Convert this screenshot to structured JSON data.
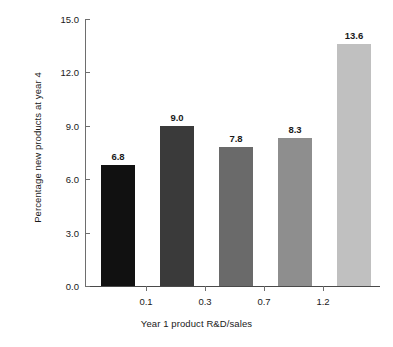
{
  "chart_data": {
    "type": "bar",
    "title": "",
    "xlabel": "Year 1 product R&D/sales",
    "ylabel": "Percentage new products at year 4",
    "categories": [
      "",
      "0.1",
      "0.3",
      "0.7",
      "1.2"
    ],
    "values": [
      6.8,
      9.0,
      7.8,
      8.3,
      13.6
    ],
    "value_labels": [
      "6.8",
      "9.0",
      "7.8",
      "8.3",
      "13.6"
    ],
    "bar_colors": [
      "#111111",
      "#3a3a3a",
      "#6a6a6a",
      "#8e8e8e",
      "#c0c0c0"
    ],
    "ylim": [
      0.0,
      15.0
    ],
    "yticks": [
      0.0,
      3.0,
      6.0,
      9.0,
      12.0,
      15.0
    ],
    "ytick_labels": [
      "0.0",
      "3.0",
      "6.0",
      "9.0",
      "12.0",
      "15.0"
    ],
    "xtick_labels": [
      "0.1",
      "0.3",
      "0.7",
      "1.2"
    ],
    "xtick_note": "x tick labels are placed in the gaps between adjacent bars",
    "grid": false,
    "legend": false,
    "background": "#ffffff",
    "axis_color": "#4a4a4a"
  }
}
